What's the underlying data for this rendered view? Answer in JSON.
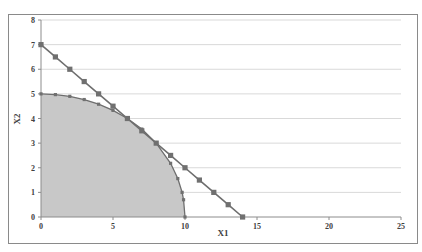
{
  "chart_data": {
    "type": "scatter",
    "title": "",
    "xlabel": "X1",
    "ylabel": "X2",
    "xlim": [
      0,
      25
    ],
    "ylim": [
      0,
      8
    ],
    "xticks": [
      0,
      5,
      10,
      15,
      20,
      25
    ],
    "yticks": [
      0,
      1,
      2,
      3,
      4,
      5,
      6,
      7,
      8
    ],
    "grid": {
      "horizontal": true,
      "vertical": false
    },
    "legend": null,
    "series": [
      {
        "name": "ellipse",
        "style": "line-with-markers, area filled below",
        "fill": "#c8c8c8",
        "x": [
          0,
          1,
          2,
          3,
          4,
          5,
          6,
          7,
          8,
          9,
          9.5,
          9.8,
          9.9,
          10
        ],
        "y": [
          5,
          4.97,
          4.9,
          4.77,
          4.58,
          4.33,
          4.0,
          3.57,
          3.0,
          2.18,
          1.56,
          1.0,
          0.7,
          0
        ]
      },
      {
        "name": "line",
        "style": "line-with-markers",
        "x": [
          0,
          1,
          2,
          3,
          4,
          5,
          6,
          7,
          8,
          9,
          10,
          11,
          12,
          13,
          14
        ],
        "y": [
          7,
          6.5,
          6,
          5.5,
          5,
          4.5,
          4,
          3.5,
          3,
          2.5,
          2,
          1.5,
          1,
          0.5,
          0
        ]
      }
    ]
  },
  "colors": {
    "line": "#6e6e6e",
    "marker": "#707070",
    "fill": "#c8c8c8",
    "grid": "#d9d9d9",
    "frame": "#8a8a8a",
    "text": "#404040"
  }
}
